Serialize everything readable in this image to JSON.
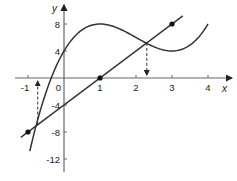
{
  "chart_data": {
    "type": "line",
    "title": "",
    "xlabel": "x",
    "ylabel": "y",
    "xlim": [
      -1.3,
      4.6
    ],
    "ylim": [
      -13.5,
      10
    ],
    "x_ticks": [
      -1,
      0,
      1,
      2,
      3,
      4
    ],
    "x_tick_labels": [
      "-1",
      "0",
      "1",
      "2",
      "3",
      "4"
    ],
    "y_ticks": [
      -12,
      -8,
      -4,
      4,
      8
    ],
    "y_tick_labels": [
      "-12",
      "-8",
      "-4",
      "4",
      "8"
    ],
    "origin_label": "0",
    "grid": false,
    "series": [
      {
        "name": "curve",
        "formula": "y = x^3 - 6x^2 + 9x + 4",
        "x_range": [
          -0.95,
          4.0
        ],
        "key_points": [
          [
            0,
            4
          ],
          [
            1,
            8
          ],
          [
            3,
            4
          ],
          [
            4,
            8
          ]
        ]
      },
      {
        "name": "line",
        "formula": "y = 4x - 4",
        "x_range": [
          -1.2,
          3.3
        ],
        "marked_points": [
          [
            -1,
            -8
          ],
          [
            1,
            0
          ],
          [
            3,
            8
          ]
        ]
      }
    ],
    "annotations": [
      {
        "type": "dashed-arrow",
        "x": -0.73,
        "from_y": -6.9,
        "to_y": 0,
        "direction": "up"
      },
      {
        "type": "dashed-arrow",
        "x": 2.3,
        "from_y": 5.2,
        "to_y": 0,
        "direction": "down"
      }
    ]
  }
}
